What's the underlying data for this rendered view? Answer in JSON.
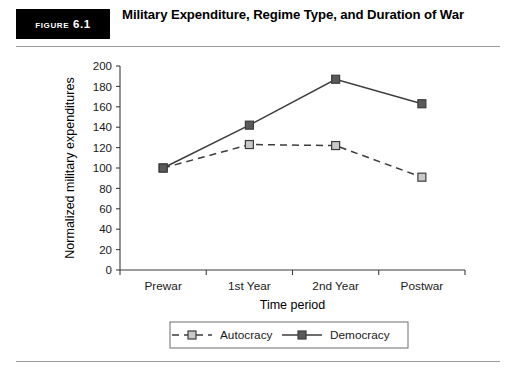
{
  "figure": {
    "tag": "Figure 6.1",
    "title": "Military Expenditure, Regime Type, and Duration of War"
  },
  "chart_data": {
    "type": "line",
    "title": "Military Expenditure, Regime Type, and Duration of War",
    "xlabel": "Time period",
    "ylabel": "Normalized military expenditures",
    "categories": [
      "Prewar",
      "1st Year",
      "2nd Year",
      "Postwar"
    ],
    "ylim": [
      0,
      200
    ],
    "yticks": [
      0,
      20,
      40,
      60,
      80,
      100,
      120,
      140,
      160,
      180,
      200
    ],
    "grid": false,
    "legend_position": "bottom",
    "series": [
      {
        "name": "Autocracy",
        "values": [
          100,
          123,
          122,
          91
        ],
        "line_style": "dashed",
        "marker": "square",
        "marker_fill": "#c9c9c9",
        "color": "#3d3d3d"
      },
      {
        "name": "Democracy",
        "values": [
          100,
          142,
          187,
          163
        ],
        "line_style": "solid",
        "marker": "square",
        "marker_fill": "#5a5a5a",
        "color": "#3d3d3d"
      }
    ]
  }
}
